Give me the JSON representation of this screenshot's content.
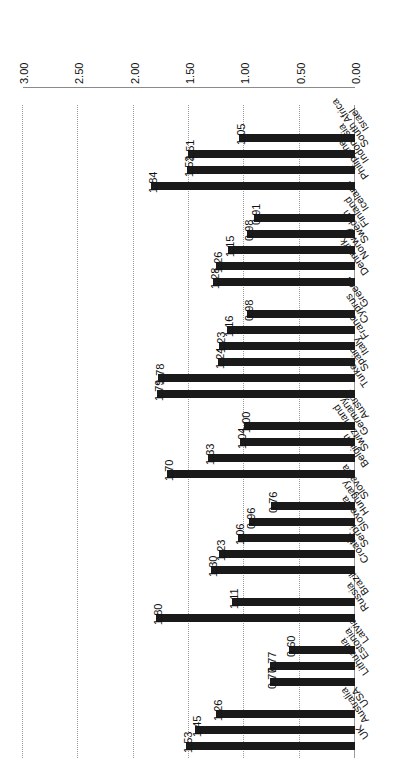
{
  "chart_data": {
    "type": "bar",
    "orientation": "horizontal",
    "title": "",
    "subtitle": "",
    "xlabel": "",
    "ylabel": "",
    "xlim": [
      0.0,
      3.0
    ],
    "xticks": [
      "0.00",
      "0.50",
      "1.00",
      "1.50",
      "2.00",
      "2.50",
      "3.00"
    ],
    "xtick_values": [
      0.0,
      0.5,
      1.0,
      1.5,
      2.0,
      2.5,
      3.0
    ],
    "grid": true,
    "grid_axis": "x",
    "grid_style": "dotted",
    "legend": "none",
    "bar_color": "#1a1a1a",
    "value_label_format": "0.00",
    "categories": [
      "UK",
      "Australia",
      "USA",
      "Lithuania",
      "Estonia",
      "Latvia",
      "Russia",
      "Brazil",
      "Croatia",
      "Serbia",
      "Slovenia",
      "Hungary",
      "Slovakia",
      "Belgium",
      "Switzerland",
      "Germany",
      "Austria",
      "Turkey",
      "Spain",
      "Italy",
      "France",
      "Cyprus",
      "Greece",
      "Denmark",
      "Norway",
      "Sweden",
      "Finland",
      "Iceland",
      "Philippines",
      "Indonesia",
      "South Africa",
      "Israel"
    ],
    "values": [
      1.53,
      1.45,
      1.26,
      0.77,
      0.77,
      0.6,
      1.8,
      1.11,
      1.3,
      1.23,
      1.06,
      0.96,
      0.76,
      1.7,
      1.33,
      1.04,
      1.0,
      1.79,
      1.78,
      1.24,
      1.23,
      1.16,
      0.98,
      1.28,
      1.26,
      1.15,
      0.98,
      0.91,
      1.84,
      1.52,
      1.51,
      1.05
    ],
    "groups": [
      {
        "name": "",
        "categories": [
          "UK",
          "Australia",
          "USA"
        ]
      },
      {
        "name": "",
        "categories": [
          "Lithuania",
          "Estonia",
          "Latvia"
        ]
      },
      {
        "name": "",
        "categories": [
          "Russia",
          "Brazil"
        ]
      },
      {
        "name": "",
        "categories": [
          "Croatia",
          "Serbia",
          "Slovenia",
          "Hungary",
          "Slovakia"
        ]
      },
      {
        "name": "",
        "categories": [
          "Belgium",
          "Switzerland",
          "Germany",
          "Austria"
        ]
      },
      {
        "name": "",
        "categories": [
          "Turkey",
          "Spain",
          "Italy",
          "France",
          "Cyprus",
          "Greece"
        ]
      },
      {
        "name": "",
        "categories": [
          "Denmark",
          "Norway",
          "Sweden",
          "Finland",
          "Iceland"
        ]
      },
      {
        "name": "",
        "categories": [
          "Philippines",
          "Indonesia",
          "South Africa",
          "Israel"
        ]
      }
    ]
  },
  "bottom_artifact": ""
}
